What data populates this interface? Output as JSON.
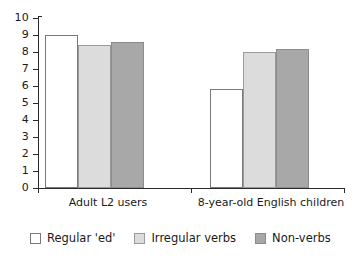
{
  "chart_data": {
    "type": "bar",
    "title": "",
    "xlabel": "",
    "ylabel": "",
    "ylim": [
      0,
      10
    ],
    "ytick_labels": [
      "10",
      "9",
      "8",
      "7",
      "6",
      "5",
      "4",
      "3",
      "2",
      "1",
      "0"
    ],
    "ytick_values": [
      10,
      9,
      8,
      7,
      6,
      5,
      4,
      3,
      2,
      1,
      0
    ],
    "grid": false,
    "legend_position": "bottom-left",
    "categories": [
      "Adult L2 users",
      "8-year-old English children"
    ],
    "series": [
      {
        "name": "Regular 'ed'",
        "color": "#ffffff",
        "values": [
          9.0,
          5.8
        ]
      },
      {
        "name": "Irregular verbs",
        "color": "#dcdcdc",
        "values": [
          8.4,
          8.0
        ]
      },
      {
        "name": "Non-verbs",
        "color": "#a8a8a8",
        "values": [
          8.6,
          8.2
        ]
      }
    ]
  },
  "axis": {
    "y_max_label": "10",
    "y_min_label": "0"
  },
  "colors": {
    "axis": "#2b2b2b",
    "bar_white": "#ffffff",
    "bar_light": "#dcdcdc",
    "bar_dark": "#a8a8a8",
    "text": "#1a1a1a"
  }
}
